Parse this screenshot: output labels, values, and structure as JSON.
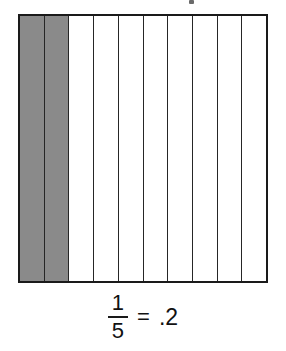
{
  "figure": {
    "name": "fraction-area-model",
    "total_parts": 10,
    "shaded_parts": 2,
    "shade_color": "#8a8a8a",
    "unshaded_color": "#ffffff",
    "border_color": "#1a1a1a",
    "divider_color": "#262626"
  },
  "caption": {
    "numerator": "1",
    "denominator": "5",
    "equals": "=",
    "decimal": ".2",
    "full_text": "1/5 = .2"
  },
  "chart_data": {
    "type": "bar",
    "title": "1/5 = .2",
    "xlabel": "",
    "ylabel": "",
    "categories": [
      "1",
      "2",
      "3",
      "4",
      "5",
      "6",
      "7",
      "8",
      "9",
      "10"
    ],
    "values": [
      1,
      1,
      0,
      0,
      0,
      0,
      0,
      0,
      0,
      0
    ],
    "series": [
      {
        "name": "shaded",
        "values": [
          1,
          1,
          0,
          0,
          0,
          0,
          0,
          0,
          0,
          0
        ]
      }
    ],
    "legend": [],
    "annotations": [
      "1/5 = .2"
    ],
    "grid": true
  },
  "cells": [
    {
      "index": 1,
      "shaded": true
    },
    {
      "index": 2,
      "shaded": true
    },
    {
      "index": 3,
      "shaded": false
    },
    {
      "index": 4,
      "shaded": false
    },
    {
      "index": 5,
      "shaded": false
    },
    {
      "index": 6,
      "shaded": false
    },
    {
      "index": 7,
      "shaded": false
    },
    {
      "index": 8,
      "shaded": false
    },
    {
      "index": 9,
      "shaded": false
    },
    {
      "index": 10,
      "shaded": false
    }
  ]
}
